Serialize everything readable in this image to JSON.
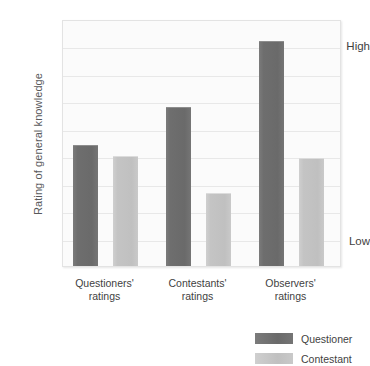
{
  "chart_data": {
    "type": "bar",
    "title": "",
    "xlabel": "",
    "ylabel": "Rating of general knowledge",
    "categories": [
      "Questioners' ratings",
      "Contestants' ratings",
      "Observers' ratings"
    ],
    "series": [
      {
        "name": "Questioner",
        "color": "#6e6e6e",
        "values": [
          55,
          72,
          102
        ]
      },
      {
        "name": "Contestant",
        "color": "#c4c4c4",
        "values": [
          50,
          33,
          49
        ]
      }
    ],
    "ylim": [
      0,
      112
    ],
    "ytick_values": [
      100,
      0
    ],
    "ytick_labels": [
      "High",
      "Low"
    ],
    "grid": true,
    "gridline_count": 9,
    "legend_position": "bottom-right"
  },
  "axis": {
    "y_title": "Rating of general knowledge",
    "y_high_label": "High",
    "y_low_label": "Low"
  },
  "legend": {
    "items": [
      {
        "label": "Questioner"
      },
      {
        "label": "Contestant"
      }
    ]
  }
}
